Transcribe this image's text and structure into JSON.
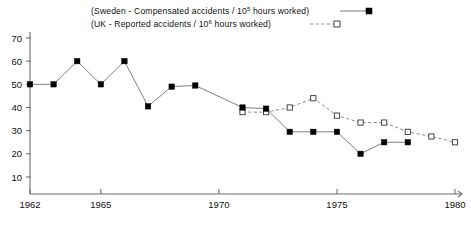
{
  "chart_data": {
    "type": "line",
    "title": "",
    "subtitle": "",
    "xlabel": "",
    "ylabel": "",
    "xlim": [
      1962,
      1980
    ],
    "ylim": [
      0,
      72
    ],
    "grid": false,
    "legend_position": "top",
    "x_ticks": [
      "1962",
      "1965",
      "1970",
      "1975",
      "1980"
    ],
    "x_tick_values": [
      1962,
      1965,
      1970,
      1975,
      1980
    ],
    "y_ticks": [
      "10",
      "20",
      "30",
      "40",
      "50",
      "60",
      "70"
    ],
    "y_tick_values": [
      10,
      20,
      30,
      40,
      50,
      60,
      70
    ],
    "series": [
      {
        "name": "Sweden - Compensated accidents / 10⁵ hours worked",
        "label_prefix": "(Sweden - Compensated accidents / 10",
        "label_exponent": "5",
        "label_suffix": " hours worked)",
        "marker": "filled-square",
        "linestyle": "solid",
        "color": "#000000",
        "x": [
          1962,
          1963,
          1964,
          1965,
          1966,
          1967,
          1968,
          1969,
          1971,
          1972,
          1973,
          1974,
          1975,
          1976,
          1977,
          1978
        ],
        "values": [
          50,
          50,
          60,
          50,
          60,
          40.5,
          49,
          49.5,
          40,
          39.5,
          29.5,
          29.5,
          29.5,
          20,
          25,
          25
        ]
      },
      {
        "name": "UK - Reported accidents / 10⁶ hours worked",
        "label_prefix": "(UK - Reported accidents / 10",
        "label_exponent": "6",
        "label_suffix": " hours worked)",
        "marker": "open-square",
        "linestyle": "dashed",
        "color": "#333333",
        "x": [
          1971,
          1972,
          1973,
          1974,
          1975,
          1976,
          1977,
          1978,
          1979,
          1980
        ],
        "values": [
          38,
          38,
          40,
          44,
          36.5,
          33.5,
          33.5,
          29.5,
          27.5,
          25
        ]
      }
    ]
  },
  "legend": {
    "entries": [
      {
        "prefix": "(Sweden - Compensated accidents / 10",
        "exponent": "5",
        "suffix": " hours worked)"
      },
      {
        "prefix": "(UK - Reported accidents / 10",
        "exponent": "6",
        "suffix": " hours worked)"
      }
    ]
  }
}
